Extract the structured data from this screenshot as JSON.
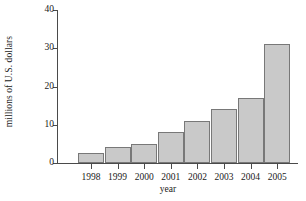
{
  "chart_data": {
    "type": "bar",
    "title": "",
    "xlabel": "year",
    "ylabel": "millions of U.S. dollars",
    "categories": [
      "1998",
      "1999",
      "2000",
      "2001",
      "2002",
      "2003",
      "2004",
      "2005"
    ],
    "values": [
      2.6,
      4.1,
      5.1,
      8.1,
      11.1,
      14.1,
      17.1,
      31.1
    ],
    "ylim": [
      0,
      40
    ],
    "yticks": [
      0,
      10,
      20,
      30,
      40
    ],
    "ytick_labels": [
      "0",
      "10",
      "20",
      "30",
      "40"
    ],
    "grid": false,
    "legend": null,
    "series": [
      {
        "name": "millions of U.S. dollars",
        "values": [
          2.6,
          4.1,
          5.1,
          8.1,
          11.1,
          14.1,
          17.1,
          31.1
        ]
      }
    ],
    "bar_fill_color": "#c9c9c9",
    "bar_edge_color": "#787878",
    "axis_color": "#4a4a4a"
  }
}
